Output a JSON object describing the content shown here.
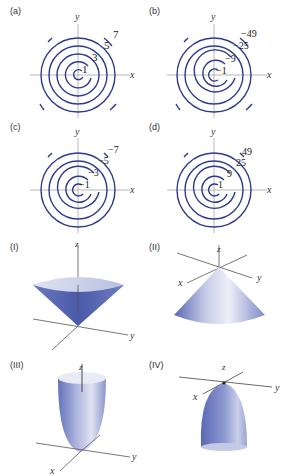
{
  "contour_panels": [
    {
      "id": "a",
      "label": "(a)",
      "x_axis": "x",
      "y_axis": "y",
      "level_labels": [
        "1",
        "3",
        "5",
        "7"
      ]
    },
    {
      "id": "b",
      "label": "(b)",
      "x_axis": "x",
      "y_axis": "y",
      "level_labels": [
        "−1",
        "−9",
        "−25",
        "−49"
      ]
    },
    {
      "id": "c",
      "label": "(c)",
      "x_axis": "x",
      "y_axis": "y",
      "level_labels": [
        "−1",
        "−3",
        "−5",
        "−7"
      ]
    },
    {
      "id": "d",
      "label": "(d)",
      "x_axis": "x",
      "y_axis": "y",
      "level_labels": [
        "1",
        "9",
        "25",
        "49"
      ]
    }
  ],
  "surface_panels": [
    {
      "id": "I",
      "label": "(I)",
      "shape": "upward-cone",
      "axes": {
        "x": "x",
        "y": "y",
        "z": "z"
      }
    },
    {
      "id": "II",
      "label": "(II)",
      "shape": "downward-cone",
      "axes": {
        "x": "x",
        "y": "y",
        "z": "z"
      }
    },
    {
      "id": "III",
      "label": "(III)",
      "shape": "upward-paraboloid",
      "axes": {
        "x": "x",
        "y": "y",
        "z": "z"
      }
    },
    {
      "id": "IV",
      "label": "(IV)",
      "shape": "downward-paraboloid",
      "axes": {
        "x": "x",
        "y": "y",
        "z": "z"
      }
    }
  ],
  "colors": {
    "contour": "#2e3a8c",
    "axis": "#555555",
    "surface_dark": "#4a5aa8",
    "surface_light": "#e6e9f4"
  }
}
